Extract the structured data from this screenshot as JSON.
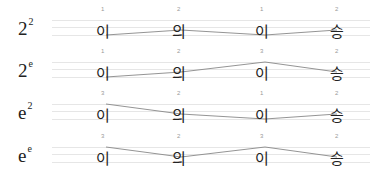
{
  "rows": [
    {
      "label_base": "2",
      "label_exp": "2",
      "tones": [
        "1",
        "2",
        "1",
        "2"
      ]
    },
    {
      "label_base": "2",
      "label_exp": "e",
      "tones": [
        "1",
        "2",
        "3",
        "2"
      ]
    },
    {
      "label_base": "e",
      "label_exp": "2",
      "tones": [
        "3",
        "2",
        "1",
        "2"
      ]
    },
    {
      "label_base": "e",
      "label_exp": "e",
      "tones": [
        "3",
        "2",
        "3",
        "2"
      ]
    }
  ],
  "syllables": [
    "이",
    "의",
    "이",
    "승"
  ],
  "colors": {
    "staff": "#e6e6e6",
    "contour": "#888888",
    "text": "#222222",
    "tone_number": "#999999"
  }
}
